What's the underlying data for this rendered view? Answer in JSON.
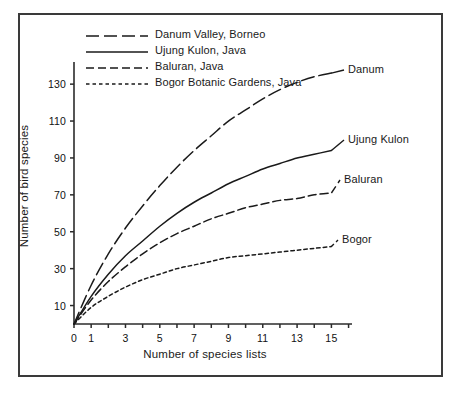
{
  "chart_data": {
    "type": "line",
    "title": "",
    "xlabel": "Number of species lists",
    "ylabel": "Number of bird species",
    "xlim": [
      0,
      16.2
    ],
    "ylim": [
      0,
      142
    ],
    "grid": false,
    "legend_position": "top-left inside plot",
    "x_ticks_major": [
      0,
      1,
      3,
      5,
      7,
      9,
      11,
      13,
      15
    ],
    "x_ticks_minor": [
      2,
      4,
      6,
      8,
      10,
      12,
      14,
      16
    ],
    "y_ticks": [
      10,
      30,
      50,
      70,
      90,
      110,
      130
    ],
    "x": [
      0,
      1,
      2,
      3,
      4,
      5,
      6,
      7,
      8,
      9,
      10,
      11,
      12,
      13,
      14,
      15
    ],
    "series": [
      {
        "name": "Danum Valley, Borneo",
        "legend_label": "Danum Valley, Borneo",
        "end_label": "Danum",
        "line_style": "long-dash",
        "color": "#1a1a1a",
        "values": [
          0,
          21,
          38,
          52,
          64,
          75,
          85,
          94,
          102,
          110,
          116,
          122,
          127,
          131,
          134,
          136
        ]
      },
      {
        "name": "Ujung Kulon, Java",
        "legend_label": "Ujung Kulon, Java",
        "end_label": "Ujung Kulon",
        "line_style": "solid",
        "color": "#1a1a1a",
        "values": [
          0,
          15,
          27,
          37,
          45,
          53,
          60,
          66,
          71,
          76,
          80,
          84,
          87,
          90,
          92,
          94
        ]
      },
      {
        "name": "Baluran, Java",
        "legend_label": "Baluran, Java",
        "end_label": "Baluran",
        "line_style": "medium-dash",
        "color": "#1a1a1a",
        "values": [
          0,
          13,
          23,
          31,
          38,
          44,
          49,
          53,
          57,
          60,
          63,
          65,
          67,
          68,
          70,
          71
        ]
      },
      {
        "name": "Bogor Botanic Gardens, Java",
        "legend_label": "Bogor Botanic Gardens, Java",
        "end_label": "Bogor",
        "line_style": "short-dash",
        "color": "#1a1a1a",
        "values": [
          0,
          9,
          15,
          20,
          24,
          27,
          30,
          32,
          34,
          36,
          37,
          38,
          39,
          40,
          41,
          42
        ]
      }
    ]
  },
  "axes": {
    "y_tick_labels": [
      "130",
      "110",
      "90",
      "70",
      "50",
      "30",
      "10"
    ],
    "x_tick_labels": [
      "0",
      "1",
      "3",
      "5",
      "7",
      "9",
      "11",
      "13",
      "15"
    ],
    "ylabel": "Number of bird species",
    "xlabel": "Number of species lists"
  },
  "legend": {
    "items": [
      {
        "label": "Danum Valley, Borneo",
        "style": "long-dash"
      },
      {
        "label": "Ujung Kulon, Java",
        "style": "solid"
      },
      {
        "label": "Baluran, Java",
        "style": "medium-dash"
      },
      {
        "label": "Bogor Botanic Gardens, Java",
        "style": "short-dash"
      }
    ]
  },
  "series_end_labels": {
    "danum": "Danum",
    "ujung_kulon": "Ujung Kulon",
    "baluran": "Baluran",
    "bogor": "Bogor"
  },
  "colors": {
    "line": "#1a1a1a",
    "axis": "#2b2b2b",
    "frame": "#3a3a3a",
    "background": "#ffffff"
  }
}
